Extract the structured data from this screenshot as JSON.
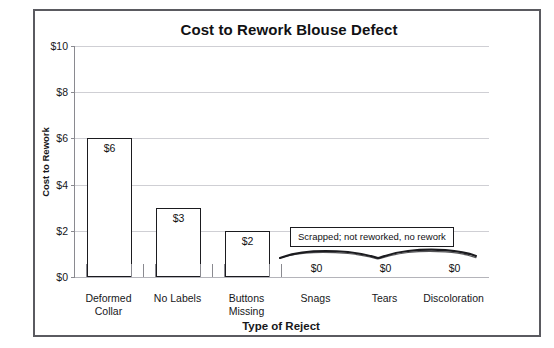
{
  "chart_data": {
    "type": "bar",
    "title": "Cost to Rework Blouse Defect",
    "xlabel": "Type of Reject",
    "ylabel": "Cost to Rework",
    "categories": [
      "Deformed Collar",
      "No Labels",
      "Buttons Missing",
      "Snags",
      "Tears",
      "Discoloration"
    ],
    "values": [
      6,
      3,
      2,
      0,
      0,
      0
    ],
    "value_labels": [
      "$6",
      "$3",
      "$2",
      "$0",
      "$0",
      "$0"
    ],
    "ylim": [
      0,
      10
    ],
    "ytick_values": [
      0,
      2,
      4,
      6,
      8,
      10
    ],
    "ytick_labels": [
      "$0",
      "$2",
      "$4",
      "$6",
      "$8",
      "$10"
    ],
    "grid": true,
    "legend": false,
    "annotations": [
      {
        "text": "Scrapped; not reworked, no rework",
        "applies_to": [
          "Snags",
          "Tears",
          "Discoloration"
        ]
      }
    ],
    "style": {
      "bar_fill": "#ffffff",
      "bar_border": "#1b1b1f",
      "gridline_color": "#cfcfd4",
      "frame_color": "#5a5a60",
      "text_color": "#17171a"
    }
  },
  "category_rows": [
    {
      "line1": "Deformed",
      "line2": "Collar"
    },
    {
      "line1": "No Labels",
      "line2": ""
    },
    {
      "line1": "Buttons",
      "line2": "Missing"
    },
    {
      "line1": "Snags",
      "line2": ""
    },
    {
      "line1": "Tears",
      "line2": ""
    },
    {
      "line1": "Discoloration",
      "line2": ""
    }
  ],
  "top_sliver_ghost": ""
}
